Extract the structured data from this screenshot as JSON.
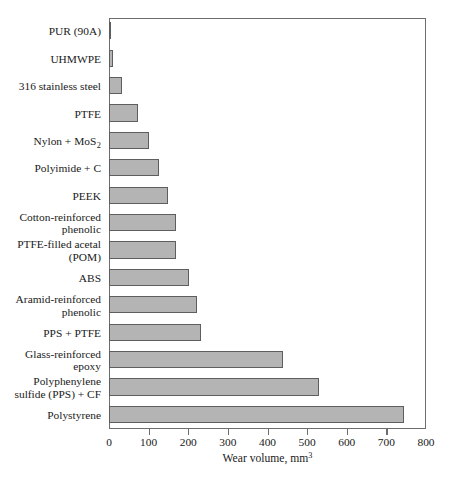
{
  "chart_data": {
    "type": "bar",
    "orientation": "horizontal",
    "title": "",
    "xlabel": "Wear volume, mm",
    "xlabel_superscript": "3",
    "ylabel": "",
    "xlim": [
      0,
      800
    ],
    "xticks": [
      0,
      100,
      200,
      300,
      400,
      500,
      600,
      700,
      800
    ],
    "xticklabels": [
      "0",
      "100",
      "200",
      "300",
      "400",
      "500",
      "600",
      "700",
      "800"
    ],
    "grid": false,
    "legend": false,
    "bar_fill_color": "#b4b4b4",
    "bar_edge_color": "#5e5e5e",
    "axis_color": "#6d6d6d",
    "categories": [
      "PUR (90A)",
      "UHMWPE",
      "316 stainless steel",
      "PTFE",
      "Nylon + MoS2",
      "Polyimide + C",
      "PEEK",
      "Cotton-reinforced\nphenolic",
      "PTFE-filled acetal\n(POM)",
      "ABS",
      "Aramid-reinforced\nphenolic",
      "PPS + PTFE",
      "Glass-reinforced\nepoxy",
      "Polyphenylene\nsulfide (PPS) + CF",
      "Polystyrene"
    ],
    "values": [
      5,
      9,
      33,
      72,
      102,
      127,
      148,
      168,
      170,
      202,
      222,
      232,
      440,
      530,
      745
    ]
  }
}
